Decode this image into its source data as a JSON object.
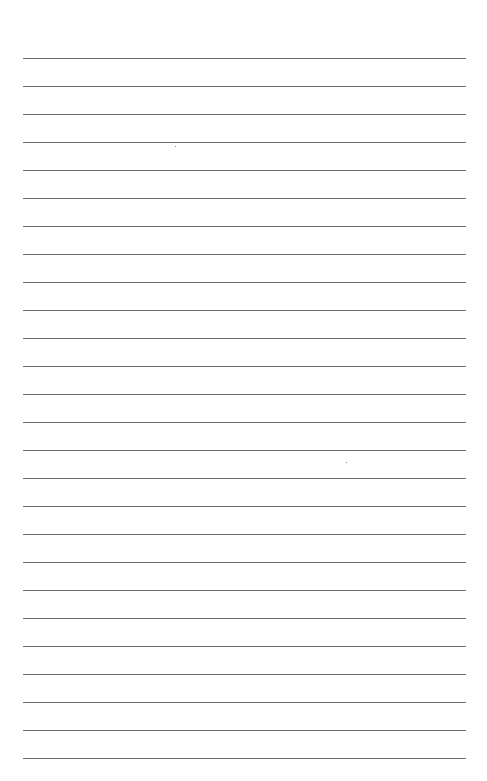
{
  "page": {
    "type": "lined-paper",
    "background_color": "#ffffff",
    "line_color": "#6e6e6e",
    "line_count": 26,
    "first_line_y": 58,
    "line_spacing": 28,
    "line_left": 23,
    "line_width": 443
  }
}
